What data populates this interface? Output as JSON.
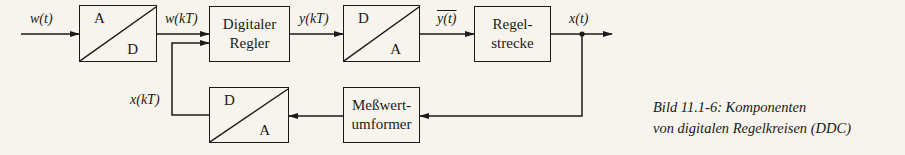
{
  "diagram": {
    "signals": {
      "w_t": "w(t)",
      "w_kT": "w(kT)",
      "y_kT": "y(kT)",
      "y_bar_t": "y(t)",
      "x_t": "x(t)",
      "x_kT": "x(kT)"
    },
    "blocks": {
      "ad_converter": {
        "top": "A",
        "bottom": "D"
      },
      "controller": {
        "line1": "Digitaler",
        "line2": "Regler"
      },
      "da_converter": {
        "top": "D",
        "bottom": "A"
      },
      "plant": {
        "line1": "Regel-",
        "line2": "strecke"
      },
      "transducer": {
        "line1": "Meßwert-",
        "line2": "umformer"
      },
      "feedback_converter": {
        "top": "D",
        "bottom": "A"
      }
    }
  },
  "caption": {
    "line1": "Bild 11.1-6:  Komponenten",
    "line2": "von digitalen Regelkreisen (DDC)"
  },
  "colors": {
    "background": "#f6f4ec",
    "ink": "#1a1a1a"
  }
}
